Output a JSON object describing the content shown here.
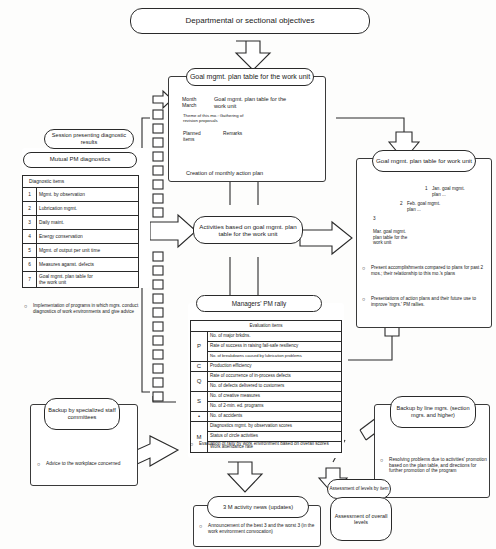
{
  "diagram": {
    "title": "Departmental or sectional objectives",
    "top_banner": {
      "label": "Departmental or sectional objectives"
    },
    "plan_table_panel": {
      "header": "Goal mgmt. plan table for the work unit",
      "sheet": {
        "month_label": "Month\nMarch",
        "sheet_title": "Goal mgmt. plan table for the\nwork unit",
        "theme_line": "Theme of this mo.: Gathering of\nrevision proposals",
        "col_planned": "Planned\nitems",
        "col_remarks": "Remarks"
      },
      "caption": "Creation of monthly action plan"
    },
    "diagnostics_panel": {
      "header_back": "Session presenting\ndiagnostic results",
      "header_front": "Mutual PM diagnostics",
      "table_title": "Diagnostic items",
      "rows": [
        {
          "no": "1",
          "item": "Mgmt. by observation"
        },
        {
          "no": "2",
          "item": "Lubrication mgmt."
        },
        {
          "no": "3",
          "item": "Daily maint."
        },
        {
          "no": "4",
          "item": "Energy conservation"
        },
        {
          "no": "5",
          "item": "Mgmt. of output per unit time"
        },
        {
          "no": "6",
          "item": "Measures aganst. defects"
        },
        {
          "no": "7",
          "item": "Goal mgmt. plan table for\nthe work unit"
        }
      ],
      "note": "Implementation of programs in which\nmgrs. conduct diagnostics of work\nenvironments and give advice"
    },
    "activities_capsule": {
      "label": "Activities based on goal mgmt.\nplan table for the work unit"
    },
    "rally_panel": {
      "header": "Managers' PM rally",
      "table_title": "Evaluation items",
      "rows": [
        {
          "group": "",
          "item": "No. of major brkdns."
        },
        {
          "group": "P",
          "item": "Rate of success in raising fail-safe resiliency"
        },
        {
          "group": "",
          "item": "No. of breakdowns caused by lubrication problems"
        },
        {
          "group": "C",
          "item": "Production efficiency"
        },
        {
          "group": "Q",
          "item": "Rate of occurrence of in-process defects"
        },
        {
          "group": "",
          "item": "No. of defects delivered to customers"
        },
        {
          "group": "S",
          "item": "No. of creative measures"
        },
        {
          "group": "",
          "item": "No. of 2-min. ed. programs"
        },
        {
          "group": "•",
          "item": "No. of accidents"
        },
        {
          "group": "M",
          "item": "Diagnostics mgmt. by observation scores"
        },
        {
          "group": "",
          "item": "Status of circle activities"
        },
        {
          "group": "",
          "item": "Work attendance rate"
        }
      ],
      "note": "Evaluation of rally by work environment based\non overall scores"
    },
    "goal_table_right_panel": {
      "header": "Goal mgmt. plan table\nfor work unit",
      "sheets": [
        {
          "no": "1",
          "label": "Jan. goal mgmt.\nplan ..."
        },
        {
          "no": "2",
          "label": "Feb. goal mgmt.\nplan ..."
        },
        {
          "no": "3",
          "label": "Mar. goal mgmt.\nplan table for the\nwork unit"
        }
      ],
      "notes": [
        "Present accomplishments\ncompared to plans for past\n2 mos.; their relationship to\nthis mo.'s plans",
        "Presentations of action plans and\ntheir future use to improve\n'mgrs.' PM rallies."
      ]
    },
    "backup_staff_panel": {
      "header": "Backup by\nspecialized staff\ncommittees",
      "note": "Advice to the\nworkplace concerned"
    },
    "backup_line_panel": {
      "header": "Backup by line\nmgrs. (section\nmgrs. and higher)",
      "note": "Resolving problems due to\nactivities' promotion based\non the plan table, and\ndirections for further\npromotion of the program"
    },
    "news_panel": {
      "header": "3 M activity news\n(updates)",
      "note": "Announcement of the best 3\nand the worst 3 (in the work\nenvironment convocation)"
    },
    "assessment_overall": {
      "label": "Assessment of\noverall levels"
    },
    "assessment_by_item": {
      "label": "Assessment of\nlevels by item"
    },
    "colors": {
      "line": "#2a2a2a",
      "shadow": "#d6d6d2",
      "paper": "#ffffff"
    }
  }
}
